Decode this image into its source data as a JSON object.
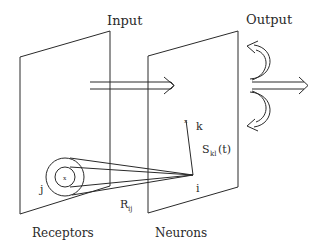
{
  "diagram": {
    "labels": {
      "input": "Input",
      "output": "Output",
      "receptors": "Receptors",
      "neurons": "Neurons",
      "j": "j",
      "k": "k",
      "i": "i",
      "r_main": "R",
      "r_sub": "ij",
      "s_main": "S",
      "s_sub": "kl",
      "s_arg": "(t)",
      "receptor_center": "x",
      "neuron_k_marker": "x"
    },
    "colors": {
      "line": "#2a2a2a",
      "background": "#ffffff"
    }
  }
}
